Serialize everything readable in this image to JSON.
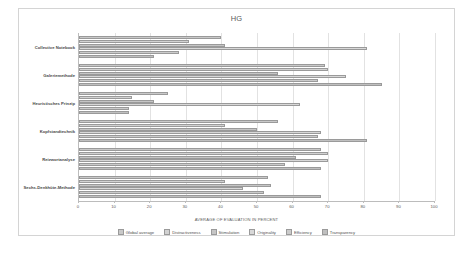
{
  "chart_data": {
    "type": "bar",
    "orientation": "horizontal",
    "title": "HG",
    "xlabel": "AVERAGE OF EVALUATION IN PERCENT",
    "ylabel": "",
    "xlim": [
      0,
      100
    ],
    "xticks": [
      0,
      10,
      20,
      30,
      40,
      50,
      60,
      70,
      80,
      90,
      100
    ],
    "grid": true,
    "legend_position": "bottom",
    "categories": [
      "Collective Notebook",
      "Galeriemethode",
      "Heuristisches Prinzip",
      "Kopfstandtechnik",
      "Reizwortanalyse",
      "Sechs-Denkhüte-Methode"
    ],
    "series": [
      {
        "name": "Global average",
        "values": [
          40,
          69,
          25,
          56,
          68,
          53
        ]
      },
      {
        "name": "Distractiveness",
        "values": [
          31,
          70,
          15,
          41,
          70,
          41
        ]
      },
      {
        "name": "Stimulation",
        "values": [
          41,
          56,
          21,
          50,
          61,
          54
        ]
      },
      {
        "name": "Originality",
        "values": [
          81,
          75,
          62,
          68,
          70,
          46
        ]
      },
      {
        "name": "Efficiency",
        "values": [
          28,
          67,
          14,
          67,
          58,
          52
        ]
      },
      {
        "name": "Transparency",
        "values": [
          21,
          85,
          14,
          81,
          68,
          68
        ]
      }
    ]
  },
  "legend": {
    "items": [
      "Global average",
      "Distractiveness",
      "Stimulation",
      "Originality",
      "Efficiency",
      "Transparency"
    ]
  }
}
